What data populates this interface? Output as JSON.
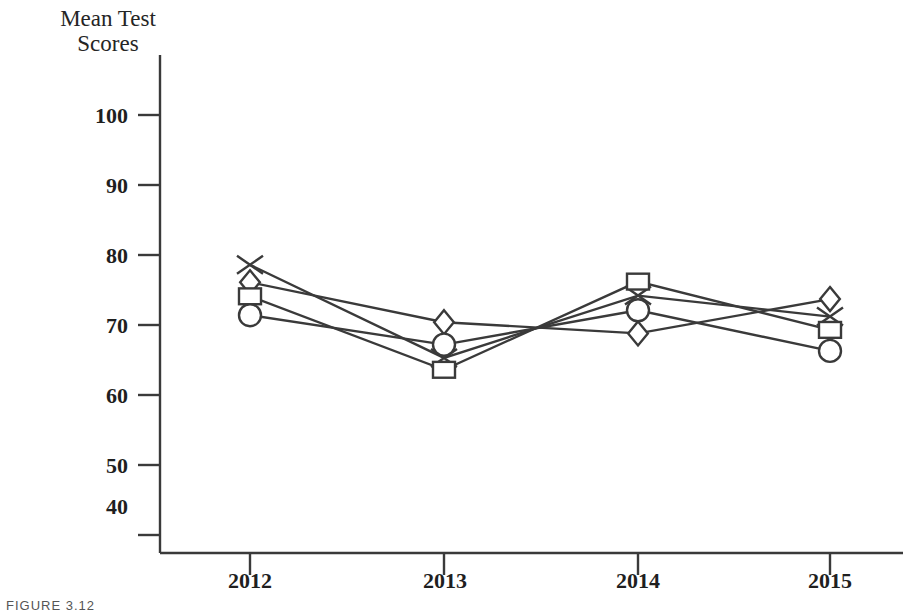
{
  "figure": {
    "caption": "FIGURE 3.12"
  },
  "chart_data": {
    "type": "line",
    "title": "",
    "ylabel": "Mean Test\nScores",
    "xlabel": "",
    "categories": [
      "2012",
      "2013",
      "2014",
      "2015"
    ],
    "yticks": [
      100,
      90,
      80,
      70,
      60,
      50,
      40
    ],
    "ylim": [
      33,
      104
    ],
    "grid": false,
    "legend": "none",
    "axis_color": "#3a3a3a",
    "line_color": "#3a3a3a",
    "series": [
      {
        "name": "Series 1",
        "marker": "triangle-filled",
        "filled": true,
        "values": [
          78.6,
          65.3,
          74.2,
          71.2
        ]
      },
      {
        "name": "Series 2",
        "marker": "diamond-open",
        "filled": false,
        "values": [
          76.1,
          70.4,
          68.8,
          73.7
        ]
      },
      {
        "name": "Series 3",
        "marker": "square-open",
        "filled": false,
        "values": [
          74.1,
          63.6,
          76.2,
          69.3
        ]
      },
      {
        "name": "Series 4",
        "marker": "circle-open",
        "filled": false,
        "values": [
          71.4,
          67.2,
          72.1,
          66.3
        ]
      }
    ]
  },
  "yaxis": {
    "labels": [
      "100",
      "90",
      "80",
      "70",
      "60",
      "50",
      "40"
    ]
  },
  "xaxis": {
    "labels": [
      "2012",
      "2013",
      "2014",
      "2015"
    ]
  }
}
